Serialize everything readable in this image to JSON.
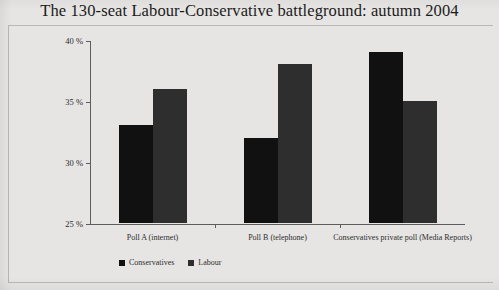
{
  "title": "The 130-seat Labour-Conservative battleground: autumn 2004",
  "legend": {
    "items": [
      {
        "label": "Conservatives",
        "color": "#111111"
      },
      {
        "label": "Labour",
        "color": "#2e2e2e"
      }
    ]
  },
  "axis": {
    "y_ticks": [
      "40 %",
      "35 %",
      "30 %",
      "25 %"
    ]
  },
  "chart_data": {
    "type": "bar",
    "title": "The 130-seat Labour-Conservative battleground: autumn 2004",
    "xlabel": "",
    "ylabel": "",
    "ylim": [
      25,
      40
    ],
    "ytick_values": [
      25,
      30,
      35,
      40
    ],
    "ytick_labels": [
      "25 %",
      "30 %",
      "35 %",
      "40 %"
    ],
    "grid": false,
    "legend_position": "bottom-left",
    "categories": [
      "Poll A (internet)",
      "Poll B (telephone)",
      "Conservatives private poll (Media Reports)"
    ],
    "series": [
      {
        "name": "Conservatives",
        "color": "#111111",
        "values": [
          33,
          32,
          39
        ]
      },
      {
        "name": "Labour",
        "color": "#2e2e2e",
        "values": [
          36,
          38,
          35
        ]
      }
    ]
  }
}
